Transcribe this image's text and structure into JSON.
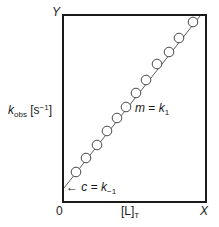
{
  "chart_data": {
    "type": "scatter",
    "title": "",
    "xlabel": "[L]T",
    "ylabel": "kobs [s-1]",
    "x_axis_end_label": "X",
    "y_axis_end_label": "Y",
    "origin_label": "0",
    "grid": false,
    "legend": null,
    "series": [
      {
        "name": "kobs vs [L]T",
        "marker": "open-circle",
        "fit": "linear",
        "points_px": [
          [
            76,
            172
          ],
          [
            86,
            158
          ],
          [
            97,
            145
          ],
          [
            107,
            131
          ],
          [
            117,
            118
          ],
          [
            126,
            107
          ],
          [
            136,
            93
          ],
          [
            146,
            80
          ],
          [
            157,
            64
          ],
          [
            169,
            52
          ],
          [
            179,
            38
          ],
          [
            193,
            22
          ]
        ]
      }
    ],
    "annotations": [
      {
        "text": "m = k1",
        "meaning": "slope"
      },
      {
        "text": "c = k-1",
        "meaning": "y-intercept",
        "arrow": "left"
      }
    ]
  },
  "labels": {
    "y_axis_main": "k",
    "y_axis_sub": "obs",
    "y_axis_unit_open": " [s",
    "y_axis_unit_sup": "−1",
    "y_axis_unit_close": "]",
    "x_axis_main": "[L]",
    "x_axis_sub": "T",
    "x_end": "X",
    "y_end": "Y",
    "origin": "0",
    "slope_var": "m",
    "slope_eq": " = ",
    "slope_k": "k",
    "slope_sub": "1",
    "intercept_arrow": "←",
    "intercept_var": "c",
    "intercept_eq": " = ",
    "intercept_k": "k",
    "intercept_sub": "−1"
  },
  "colors": {
    "frame": "#1a1a1a",
    "marker_fill": "#ffffff",
    "line": "#333333"
  }
}
